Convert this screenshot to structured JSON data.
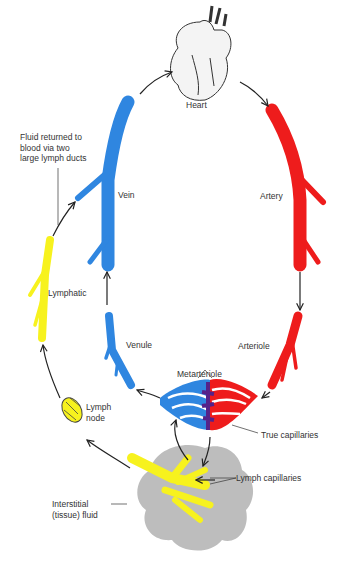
{
  "colors": {
    "vein": "#2f86e0",
    "artery": "#ee1c1c",
    "lymph": "#f7f21e",
    "capillary_mid": "#55228a",
    "tissue": "#bdbdbd",
    "arrow": "#222222",
    "text": "#333333"
  },
  "labels": {
    "heart": "Heart",
    "artery": "Artery",
    "arteriole": "Arteriole",
    "metarteriole": "Metarteriole",
    "true_capillaries": "True capillaries",
    "lymph_capillaries": "Lymph capillaries",
    "interstitial": "Interstitial\n(tissue) fluid",
    "lymph_node": "Lymph\nnode",
    "lymphatic": "Lymphatic",
    "venule": "Venule",
    "vein": "Vein",
    "fluid_returned": "Fluid returned to\nblood via two\nlarge lymph ducts"
  },
  "icons": [
    "heart-illustration",
    "lymph-node-icon",
    "tissue-blob"
  ]
}
